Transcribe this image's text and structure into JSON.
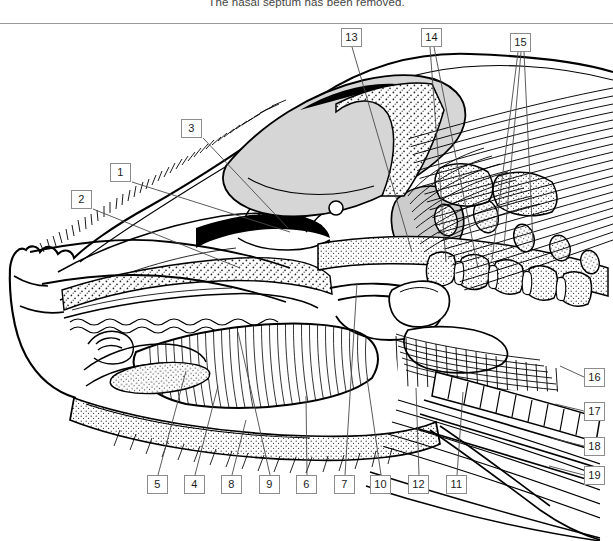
{
  "figure": {
    "caption": "The nasal septum has been removed.",
    "line_color": "#000000",
    "label_border_color": "#8c8c8c",
    "leader_color": "#5a5a5a",
    "background": "#ffffff"
  },
  "labels": [
    {
      "id": "1",
      "text": "1",
      "x": 110,
      "y": 163,
      "leader": [
        [
          132,
          182
        ],
        [
          290,
          232
        ]
      ]
    },
    {
      "id": "2",
      "text": "2",
      "x": 71,
      "y": 190,
      "leader": [
        [
          93,
          209
        ],
        [
          240,
          268
        ]
      ]
    },
    {
      "id": "3",
      "text": "3",
      "x": 181,
      "y": 119,
      "leader": [
        [
          203,
          138
        ],
        [
          288,
          228
        ]
      ]
    },
    {
      "id": "4",
      "text": "4",
      "x": 184,
      "y": 475,
      "leader": [
        [
          195,
          475
        ],
        [
          218,
          386
        ]
      ]
    },
    {
      "id": "5",
      "text": "5",
      "x": 147,
      "y": 475,
      "leader": [
        [
          158,
          475
        ],
        [
          186,
          371
        ]
      ]
    },
    {
      "id": "6",
      "text": "6",
      "x": 296,
      "y": 475,
      "leader": [
        [
          307,
          475
        ],
        [
          306,
          396
        ]
      ]
    },
    {
      "id": "7",
      "text": "7",
      "x": 334,
      "y": 475,
      "leader": [
        [
          345,
          475
        ],
        [
          357,
          283
        ]
      ]
    },
    {
      "id": "8",
      "text": "8",
      "x": 221,
      "y": 475,
      "leader": [
        [
          232,
          475
        ],
        [
          246,
          420
        ]
      ]
    },
    {
      "id": "9",
      "text": "9",
      "x": 259,
      "y": 475,
      "leader": [
        [
          270,
          475
        ],
        [
          238,
          332
        ]
      ]
    },
    {
      "id": "10",
      "text": "10",
      "x": 370,
      "y": 475,
      "leader": [
        [
          381,
          475
        ],
        [
          367,
          378
        ]
      ]
    },
    {
      "id": "11",
      "text": "11",
      "x": 446,
      "y": 475,
      "leader": [
        [
          457,
          475
        ],
        [
          463,
          392
        ]
      ]
    },
    {
      "id": "12",
      "text": "12",
      "x": 408,
      "y": 475,
      "leader": [
        [
          419,
          475
        ],
        [
          416,
          388
        ]
      ]
    },
    {
      "id": "13",
      "text": "13",
      "x": 341,
      "y": 28,
      "leader": [
        [
          352,
          47
        ],
        [
          412,
          252
        ]
      ]
    },
    {
      "id": "14",
      "text": "14",
      "x": 421,
      "y": 28,
      "leader": [
        [
          430,
          47
        ],
        [
          446,
          262
        ]
      ],
      "leader2": [
        [
          434,
          47
        ],
        [
          478,
          268
        ]
      ]
    },
    {
      "id": "15",
      "text": "15",
      "x": 510,
      "y": 33,
      "leader": [
        [
          518,
          52
        ],
        [
          492,
          260
        ]
      ],
      "leader2": [
        [
          521,
          52
        ],
        [
          504,
          246
        ]
      ],
      "leader3": [
        [
          524,
          52
        ],
        [
          533,
          243
        ]
      ]
    },
    {
      "id": "16",
      "text": "16",
      "x": 584,
      "y": 368,
      "leader": [
        [
          584,
          377
        ],
        [
          560,
          366
        ]
      ]
    },
    {
      "id": "17",
      "text": "17",
      "x": 584,
      "y": 402,
      "leader": [
        [
          584,
          411
        ],
        [
          555,
          404
        ]
      ]
    },
    {
      "id": "18",
      "text": "18",
      "x": 584,
      "y": 437,
      "leader": [
        [
          584,
          446
        ],
        [
          551,
          438
        ]
      ]
    },
    {
      "id": "19",
      "text": "19",
      "x": 584,
      "y": 466,
      "leader": [
        [
          584,
          475
        ],
        [
          549,
          466
        ]
      ]
    }
  ]
}
